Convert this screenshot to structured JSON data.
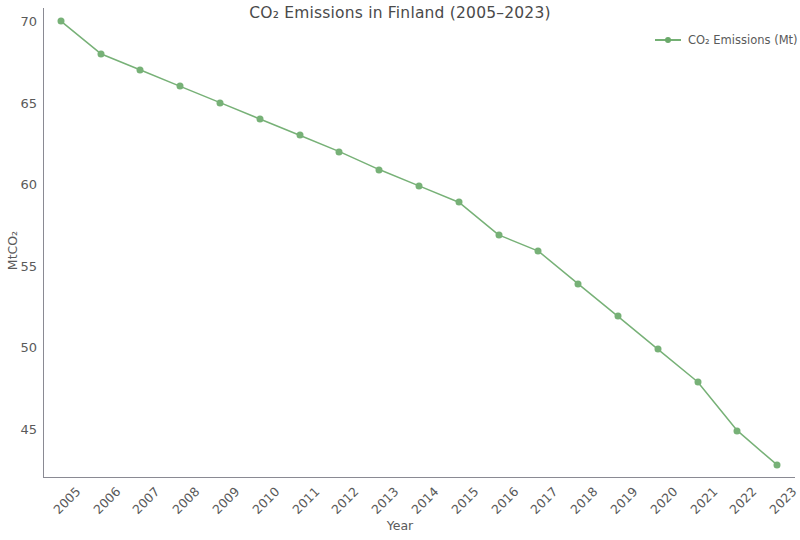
{
  "chart_data": {
    "type": "line",
    "title": "CO₂ Emissions in Finland (2005–2023)",
    "xlabel": "Year",
    "ylabel": "MtCO₂",
    "x": [
      2005,
      2006,
      2007,
      2008,
      2009,
      2010,
      2011,
      2012,
      2013,
      2014,
      2015,
      2016,
      2017,
      2018,
      2019,
      2020,
      2021,
      2022,
      2023
    ],
    "categories": [
      "2005",
      "2006",
      "2007",
      "2008",
      "2009",
      "2010",
      "2011",
      "2012",
      "2013",
      "2014",
      "2015",
      "2016",
      "2017",
      "2018",
      "2019",
      "2020",
      "2021",
      "2022",
      "2023"
    ],
    "series": [
      {
        "name": "CO₂ Emissions (Mt)",
        "color": "#77b177",
        "marker": "circle",
        "values": [
          70.0,
          68.0,
          67.0,
          66.0,
          65.0,
          64.0,
          63.0,
          62.0,
          60.9,
          59.9,
          58.9,
          56.9,
          55.9,
          53.9,
          51.9,
          49.9,
          47.9,
          44.9,
          42.8
        ]
      }
    ],
    "ylim": [
      42.0,
      70.8
    ],
    "xlim": [
      2004.55,
      2023.45
    ],
    "yticks": [
      45,
      50,
      55,
      60,
      65,
      70
    ],
    "ytick_labels": [
      "45",
      "50",
      "55",
      "60",
      "65",
      "70"
    ],
    "xticks": [
      2005,
      2006,
      2007,
      2008,
      2009,
      2010,
      2011,
      2012,
      2013,
      2014,
      2015,
      2016,
      2017,
      2018,
      2019,
      2020,
      2021,
      2022,
      2023
    ],
    "grid": false,
    "legend_position": "top-right",
    "xtick_rotation": -45,
    "background_color": "#ffffff",
    "axis_color": "#8a8a93",
    "text_color": "#5a5a5a"
  },
  "legend": {
    "entries": [
      {
        "label": "CO₂ Emissions (Mt)",
        "color": "#77b177"
      }
    ]
  }
}
